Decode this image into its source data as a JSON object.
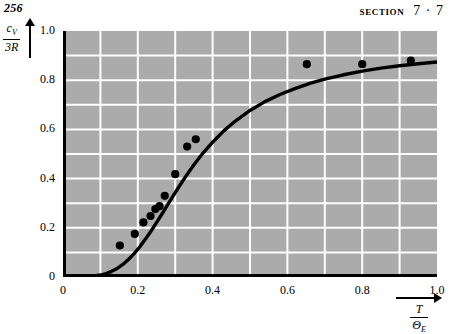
{
  "page": {
    "number": "256"
  },
  "header": {
    "section_word": "SECTION",
    "section_number": "7 · 7"
  },
  "axis_labels": {
    "y_numerator": "c",
    "y_numerator_sub": "V",
    "y_denominator": "3R",
    "x_numerator": "T",
    "x_denominator": "Θ",
    "x_denominator_sub": "E"
  },
  "colors": {
    "plot_background": "#ababab",
    "gridline": "#ffffff",
    "curve": "#000000",
    "point": "#000000",
    "axis": "#000000",
    "page_background": "#ffffff"
  },
  "chart_data": {
    "type": "scatter",
    "title": "",
    "subtitle": "",
    "xlabel": "T / Θ_E",
    "ylabel": "c_V / 3R",
    "xlim": [
      0,
      1.0
    ],
    "ylim": [
      0,
      1.0
    ],
    "grid": true,
    "grid_step_x": 0.1,
    "grid_step_y": 0.1,
    "legend": "none",
    "x_ticks": [
      0,
      0.2,
      0.4,
      0.6,
      0.8,
      1.0
    ],
    "x_tick_labels": [
      "0",
      "0.2",
      "0.4",
      "0.6",
      "0.8",
      "1.0"
    ],
    "y_ticks": [
      0,
      0.2,
      0.4,
      0.6,
      0.8,
      1.0
    ],
    "y_tick_labels": [
      "0",
      "0.2",
      "0.4",
      "0.6",
      "0.8",
      "1.0"
    ],
    "series": [
      {
        "name": "Einstein model curve",
        "type": "line",
        "x": [
          0.0,
          0.04,
          0.06,
          0.08,
          0.1,
          0.115,
          0.13,
          0.145,
          0.16,
          0.175,
          0.19,
          0.205,
          0.22,
          0.235,
          0.25,
          0.265,
          0.28,
          0.295,
          0.31,
          0.33,
          0.35,
          0.375,
          0.4,
          0.43,
          0.46,
          0.5,
          0.54,
          0.58,
          0.62,
          0.66,
          0.7,
          0.75,
          0.8,
          0.85,
          0.9,
          0.95,
          1.0
        ],
        "y": [
          0.0,
          0.0,
          0.001,
          0.003,
          0.008,
          0.014,
          0.023,
          0.035,
          0.051,
          0.071,
          0.095,
          0.122,
          0.153,
          0.186,
          0.221,
          0.257,
          0.294,
          0.331,
          0.367,
          0.413,
          0.456,
          0.505,
          0.548,
          0.594,
          0.633,
          0.677,
          0.713,
          0.742,
          0.766,
          0.787,
          0.804,
          0.822,
          0.837,
          0.849,
          0.859,
          0.867,
          0.874
        ]
      },
      {
        "name": "Measured data points",
        "type": "scatter",
        "x": [
          0.152,
          0.192,
          0.215,
          0.234,
          0.247,
          0.258,
          0.272,
          0.3,
          0.332,
          0.355,
          0.652,
          0.8,
          0.93
        ],
        "y": [
          0.128,
          0.175,
          0.222,
          0.248,
          0.276,
          0.288,
          0.33,
          0.418,
          0.53,
          0.56,
          0.865,
          0.865,
          0.88
        ]
      }
    ]
  }
}
